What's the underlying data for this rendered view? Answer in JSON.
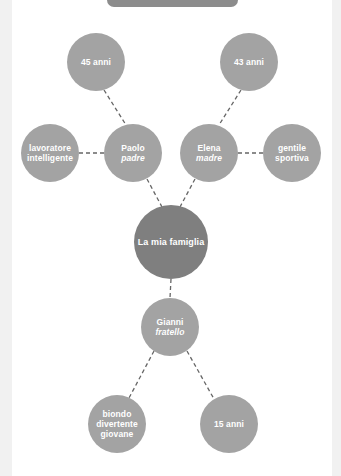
{
  "diagram": {
    "title_bar": "",
    "center": {
      "label": "La mia famiglia"
    },
    "nodes": {
      "father": {
        "name": "Paolo",
        "role": "padre"
      },
      "mother": {
        "name": "Elena",
        "role": "madre"
      },
      "brother": {
        "name": "Gianni",
        "role": "fratello"
      },
      "father_age": {
        "label": "45 anni"
      },
      "mother_age": {
        "label": "43 anni"
      },
      "father_traits": {
        "line1": "lavoratore",
        "line2": "intelligente"
      },
      "mother_traits": {
        "line1": "gentile",
        "line2": "sportiva"
      },
      "brother_traits": {
        "line1": "biondo",
        "line2": "divertente",
        "line3": "giovane"
      },
      "brother_age": {
        "label": "15 anni"
      }
    },
    "colors": {
      "node": "#a3a3a3",
      "center_node": "#7f7f7f",
      "link": "#666666",
      "text": "#ffffff",
      "background": "#ffffff",
      "margin": "#f1f1f1"
    }
  }
}
